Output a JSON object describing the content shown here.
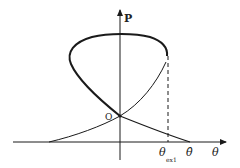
{
  "diagram": {
    "axes": {
      "vertical_label": "P",
      "horizontal_label": "θ"
    },
    "points": {
      "origin_label": "O",
      "theta_ext_label": "θ",
      "theta_ext_subscript": "ex1",
      "theta_hat_label": "θ̂"
    },
    "colors": {
      "stroke": "#1a1a1a",
      "background": "#ffffff"
    }
  }
}
